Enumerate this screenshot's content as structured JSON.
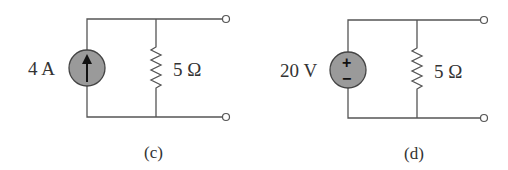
{
  "figure": {
    "circuit_c": {
      "source_type": "current-source",
      "source_label": "4 A",
      "source_direction": "up",
      "resistor_label": "5 Ω",
      "caption": "(c)"
    },
    "circuit_d": {
      "source_type": "voltage-source",
      "source_label": "20 V",
      "plus_sign": "+",
      "minus_sign": "−",
      "resistor_label": "5 Ω",
      "caption": "(d)"
    },
    "colors": {
      "wire": "#555555",
      "source_fill": "#9a9a9a",
      "text": "#333333"
    }
  }
}
